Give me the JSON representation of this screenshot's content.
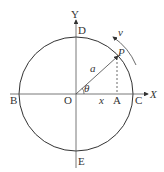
{
  "diagram": {
    "labels": {
      "Y": "Y",
      "X": "X",
      "D": "D",
      "E": "E",
      "B": "B",
      "C": "C",
      "O": "O",
      "A": "A",
      "P": "P",
      "a": "a",
      "x": "x",
      "theta": "θ",
      "v": "v"
    },
    "colors": {
      "stroke": "#333333",
      "background": "#ffffff"
    }
  }
}
